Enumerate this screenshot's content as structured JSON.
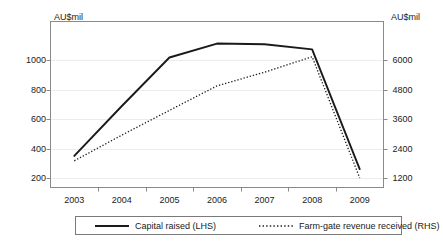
{
  "chart_data": {
    "type": "line",
    "title": "",
    "xlabel": "",
    "ylabel": "AU$mil",
    "y2label": "AU$mil",
    "grid": true,
    "legend_position": "bottom",
    "x": [
      2003,
      2004,
      2005,
      2006,
      2007,
      2008,
      2009
    ],
    "categories": [
      "2003",
      "2004",
      "2005",
      "2006",
      "2007",
      "2008",
      "2009"
    ],
    "axes": {
      "left": {
        "label": "AU$mil",
        "ticks": [
          1000,
          800,
          600,
          400,
          200
        ],
        "tick_labels": [
          "1000",
          "800",
          "600",
          "400",
          "200"
        ],
        "ylim": [
          135,
          1265
        ]
      },
      "right": {
        "label": "AU$mil",
        "ticks": [
          6000,
          4800,
          3600,
          2400,
          1200
        ],
        "tick_labels": [
          "6000",
          "4800",
          "3600",
          "2400",
          "1200"
        ],
        "ylim": [
          810,
          7590
        ]
      }
    },
    "series": [
      {
        "name": "Capital raised (LHS)",
        "axis": "left",
        "style": "solid",
        "color": "#1a1a1a",
        "width": 1.9,
        "values": [
          350,
          690,
          1020,
          1115,
          1110,
          1075,
          260
        ]
      },
      {
        "name": "Farm-gate revenue received (RHS)",
        "axis": "right",
        "style": "dotted",
        "color": "#1a1a1a",
        "width": 1.3,
        "values": [
          1900,
          2950,
          3960,
          4960,
          5520,
          6150,
          1200
        ]
      }
    ]
  },
  "legend": {
    "items": [
      {
        "label": "Capital raised (LHS)",
        "style": "solid"
      },
      {
        "label": "Farm-gate revenue received (RHS)",
        "style": "dotted"
      }
    ]
  }
}
